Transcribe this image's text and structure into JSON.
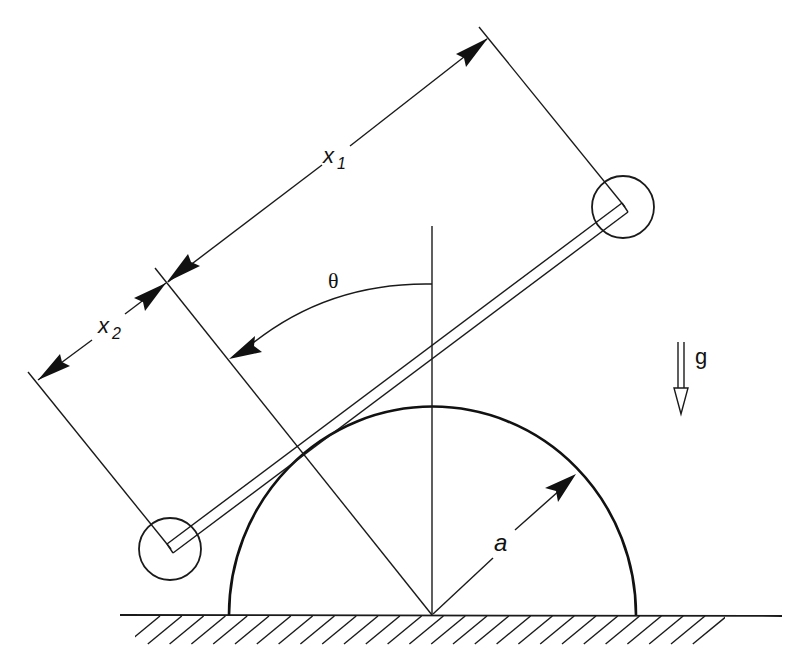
{
  "diagram": {
    "labels": {
      "x1": {
        "base": "x",
        "sub": "1"
      },
      "x2": {
        "base": "x",
        "sub": "2"
      },
      "theta": "θ",
      "gravity": "g",
      "radius": "a"
    },
    "elements": {
      "rod": "massless rod (double line) tangent to semicircle",
      "masses": [
        "upper point mass",
        "lower point mass"
      ],
      "surface": "semicircle of radius a on hatched ground",
      "reference": "vertical through semicircle center",
      "angle": "θ measured from vertical to normal through tangent point"
    },
    "colors": {
      "ink": "#111111",
      "background": "#ffffff"
    }
  }
}
